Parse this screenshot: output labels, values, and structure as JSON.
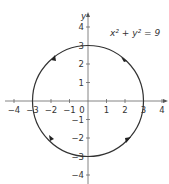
{
  "chart_data": {
    "type": "line",
    "title": "",
    "equation": "x² + y² = 9",
    "xlabel": "x",
    "ylabel": "y",
    "xlim": [
      -4,
      4
    ],
    "ylim": [
      -4,
      4
    ],
    "x_ticks": [
      "-4",
      "-3",
      "-2",
      "-1",
      "0",
      "1",
      "2",
      "3",
      "4"
    ],
    "y_ticks": [
      "-4",
      "-3",
      "-2",
      "-1",
      "1",
      "2",
      "3",
      "4"
    ],
    "series": [
      {
        "name": "circle",
        "center": [
          0,
          0
        ],
        "radius": 3,
        "orientation": "counterclockwise",
        "arrows": 4
      }
    ],
    "colors": {
      "curve": "#333333",
      "axis": "#555555"
    }
  }
}
